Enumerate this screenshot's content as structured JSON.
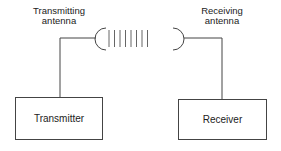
{
  "diagram": {
    "title": "",
    "transmitting_antenna": {
      "line1": "Transmitting",
      "line2": "antenna"
    },
    "receiving_antenna": {
      "line1": "Receiving",
      "line2": "antenna"
    },
    "transmitter_box": {
      "label": "Transmitter"
    },
    "receiver_box": {
      "label": "Receiver"
    },
    "wave_lines_count": 8,
    "colors": {
      "stroke": "#444444",
      "text": "#222222",
      "background": "#ffffff"
    }
  }
}
